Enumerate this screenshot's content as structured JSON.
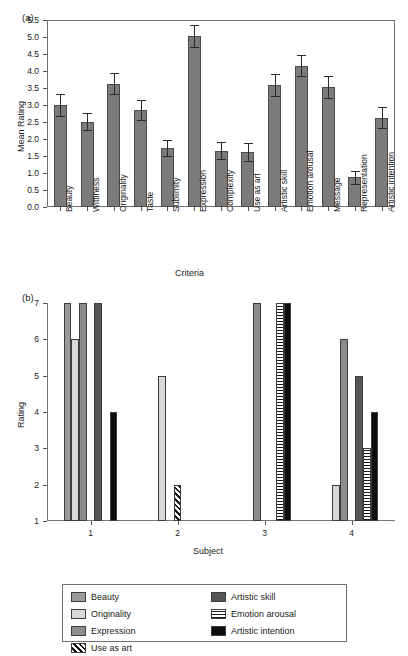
{
  "chart_data": [
    {
      "type": "bar",
      "panel": "(a)",
      "title": "",
      "xlabel": "Criteria",
      "ylabel": "Mean Rating",
      "ylim": [
        0.0,
        5.5
      ],
      "yticks": [
        "0.0",
        "0.5",
        "1.0",
        "1.5",
        "2.0",
        "2.5",
        "3.0",
        "3.5",
        "4.0",
        "4.5",
        "5.0",
        "5.5"
      ],
      "grid": false,
      "legend": "none",
      "bar_color": "#7b7b7b",
      "categories": [
        "Beauty",
        "Wittiness",
        "Originality",
        "Taste",
        "Sublimity",
        "Expression",
        "Complexity",
        "Use as art",
        "Artistic skill",
        "Emotion arousal",
        "Message",
        "Representation",
        "Artistic intention"
      ],
      "values": [
        3.0,
        2.51,
        3.63,
        2.85,
        1.74,
        5.03,
        1.66,
        1.61,
        3.59,
        4.16,
        3.53,
        0.87,
        2.62
      ],
      "errors": [
        0.31,
        0.25,
        0.31,
        0.29,
        0.23,
        0.31,
        0.26,
        0.27,
        0.32,
        0.3,
        0.31,
        0.18,
        0.31
      ]
    },
    {
      "type": "bar",
      "panel": "(b)",
      "title": "",
      "xlabel": "Subject",
      "ylabel": "Rating",
      "ylim": [
        1,
        7
      ],
      "yticks": [
        "1",
        "2",
        "3",
        "4",
        "5",
        "6",
        "7"
      ],
      "grid": false,
      "legend": "bottom",
      "categories": [
        "1",
        "2",
        "3",
        "4"
      ],
      "series": [
        {
          "name": "Beauty",
          "color": "#9a9a9a",
          "pattern": "solid",
          "values": [
            7,
            null,
            null,
            null
          ]
        },
        {
          "name": "Originality",
          "color": "#d8d8d8",
          "pattern": "solid",
          "values": [
            6,
            5,
            null,
            2
          ]
        },
        {
          "name": "Expression",
          "color": "#8d8d8d",
          "pattern": "solid",
          "values": [
            7,
            null,
            7,
            6
          ]
        },
        {
          "name": "Use as art",
          "color": "#141414",
          "pattern": "diagonal-hatch",
          "values": [
            null,
            2,
            null,
            null
          ]
        },
        {
          "name": "Artistic skill",
          "color": "#565656",
          "pattern": "solid",
          "values": [
            7,
            null,
            null,
            5
          ]
        },
        {
          "name": "Emotion arousal",
          "color": "#1a1a1a",
          "pattern": "checker",
          "values": [
            null,
            null,
            7,
            3
          ]
        },
        {
          "name": "Artistic intention",
          "color": "#0d0d0d",
          "pattern": "solid",
          "values": [
            4,
            null,
            7,
            4
          ]
        }
      ]
    }
  ],
  "panel_a": {
    "tag": "(a)",
    "ylabel": "Mean Rating",
    "xlabel": "Criteria"
  },
  "panel_b": {
    "tag": "(b)",
    "ylabel": "Rating",
    "xlabel": "Subject"
  },
  "legend": {
    "left_column": [
      "Beauty",
      "Originality",
      "Expression",
      "Use as art"
    ],
    "right_column": [
      "Artistic skill",
      "Emotion arousal",
      "Artistic intention"
    ]
  }
}
